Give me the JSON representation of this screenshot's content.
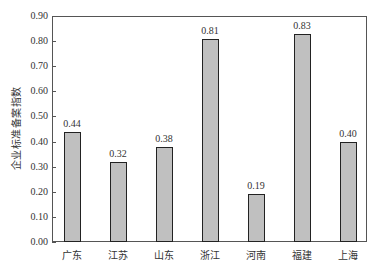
{
  "chart_data": {
    "type": "bar",
    "title": "",
    "xlabel": "",
    "ylabel": "企业标准备案指数",
    "categories": [
      "广东",
      "江苏",
      "山东",
      "浙江",
      "河南",
      "福建",
      "上海"
    ],
    "values": [
      0.44,
      0.32,
      0.38,
      0.81,
      0.19,
      0.83,
      0.4
    ],
    "value_labels": [
      "0.44",
      "0.32",
      "0.38",
      "0.81",
      "0.19",
      "0.83",
      "0.40"
    ],
    "ylim": [
      0,
      0.9
    ],
    "yticks": [
      "0.00",
      "0.10",
      "0.20",
      "0.30",
      "0.40",
      "0.50",
      "0.60",
      "0.70",
      "0.80",
      "0.90"
    ],
    "grid": false,
    "legend": null,
    "bar_color": "#c0c0c0",
    "bar_edge_color": "#222222"
  }
}
